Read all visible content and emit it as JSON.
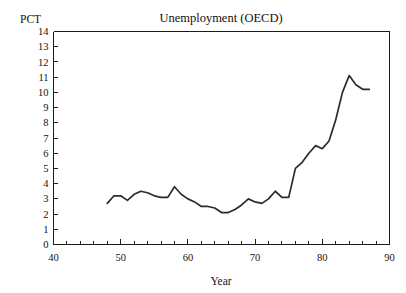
{
  "chart_data": {
    "type": "line",
    "title": "Unemployment (OECD)",
    "xlabel": "Year",
    "ylabel": "PCT",
    "xlim": [
      40,
      90
    ],
    "ylim": [
      0,
      14
    ],
    "grid": false,
    "legend": null,
    "x_major_ticks": [
      40,
      50,
      60,
      70,
      80,
      90
    ],
    "x_major_tick_labels": [
      "40",
      "50",
      "60",
      "70",
      "80",
      "90"
    ],
    "x_minor_tick_step": 2,
    "y_ticks": [
      0,
      1,
      2,
      3,
      4,
      5,
      6,
      7,
      8,
      9,
      10,
      11,
      12,
      13,
      14
    ],
    "y_tick_labels": [
      "0",
      "1",
      "2",
      "3",
      "4",
      "5",
      "6",
      "7",
      "8",
      "9",
      "10",
      "11",
      "12",
      "13",
      "14"
    ],
    "series": [
      {
        "name": "Unemployment (OECD)",
        "color": "#2b2b2b",
        "x": [
          48,
          49,
          50,
          51,
          52,
          53,
          54,
          55,
          56,
          57,
          58,
          59,
          60,
          61,
          62,
          63,
          64,
          65,
          66,
          67,
          68,
          69,
          70,
          71,
          72,
          73,
          74,
          75,
          76,
          77,
          78,
          79,
          80,
          81,
          82,
          83,
          84,
          85,
          86,
          87
        ],
        "values": [
          2.7,
          3.2,
          3.2,
          2.9,
          3.3,
          3.5,
          3.4,
          3.2,
          3.1,
          3.1,
          3.8,
          3.3,
          3.0,
          2.8,
          2.5,
          2.5,
          2.4,
          2.1,
          2.1,
          2.3,
          2.6,
          3.0,
          2.8,
          2.7,
          3.0,
          3.5,
          3.1,
          3.1,
          5.0,
          5.4,
          6.0,
          6.5,
          6.3,
          6.8,
          8.2,
          10.0,
          11.1,
          10.5,
          10.2,
          10.2
        ]
      }
    ]
  }
}
